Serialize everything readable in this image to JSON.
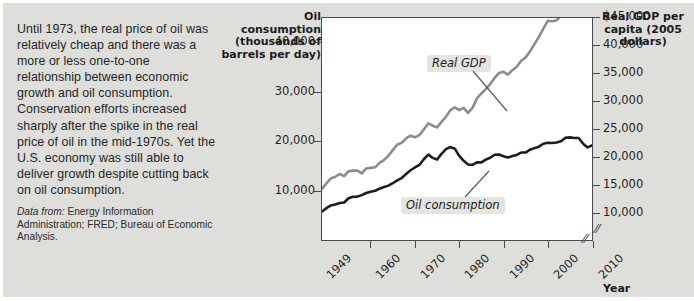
{
  "caption": {
    "body": "Until 1973, the real price of oil was relatively cheap and there was a more or less one-to-one relationship between economic growth and oil consumption. Conservation efforts increased sharply after the spike in the real price of oil in the mid-1970s. Yet the U.S. economy was still able to deliver growth despite cutting back on oil consumption.",
    "source_lead": "Data from:",
    "source_text": " Energy Information Administration; FRED; Bureau of Economic Analysis."
  },
  "chart_data": {
    "type": "line",
    "title": "",
    "xlabel": "Year",
    "ylabel": "Oil consumption (thousands of barrels per day)",
    "y2label": "Real GDP per capita (2005 dollars)",
    "grid": false,
    "legend_position": "in-plot-annotations",
    "axis_break": true,
    "x": [
      1949,
      1950,
      1951,
      1952,
      1953,
      1954,
      1955,
      1956,
      1957,
      1958,
      1959,
      1960,
      1961,
      1962,
      1963,
      1964,
      1965,
      1966,
      1967,
      1968,
      1969,
      1970,
      1971,
      1972,
      1973,
      1974,
      1975,
      1976,
      1977,
      1978,
      1979,
      1980,
      1981,
      1982,
      1983,
      1984,
      1985,
      1986,
      1987,
      1988,
      1989,
      1990,
      1991,
      1992,
      1993,
      1994,
      1995,
      1996,
      1997,
      1998,
      1999,
      2000,
      2001,
      2002,
      2003,
      2004,
      2005,
      2006,
      2007,
      2008,
      2009,
      2010
    ],
    "xlim": [
      1949,
      2010
    ],
    "xticks": [
      1949,
      1960,
      1970,
      1980,
      1990,
      2000,
      2010
    ],
    "xtick_labels": [
      "1949",
      "1960",
      "1970",
      "1980",
      "1990",
      "2000",
      "2010"
    ],
    "ylim": [
      0,
      45000
    ],
    "yticks": [
      10000,
      20000,
      30000,
      40000
    ],
    "ytick_labels": [
      "10,000",
      "20,000",
      "30,000",
      "40,000"
    ],
    "y2lim": [
      5000,
      45000
    ],
    "y2ticks": [
      10000,
      15000,
      20000,
      25000,
      30000,
      35000,
      40000,
      45000
    ],
    "y2tick_labels": [
      "10,000",
      "15,000",
      "20,000",
      "25,000",
      "30,000",
      "35,000",
      "40,000",
      "$45,000"
    ],
    "series": [
      {
        "name": "Oil consumption",
        "axis": "left",
        "color": "#1d1d1f",
        "units": "thousands of barrels per day",
        "values": [
          5760,
          6460,
          7000,
          7200,
          7500,
          7600,
          8460,
          8780,
          8800,
          9100,
          9530,
          9800,
          9980,
          10400,
          10740,
          11020,
          11510,
          12080,
          12560,
          13390,
          14140,
          14700,
          15210,
          16370,
          17310,
          16650,
          16320,
          17460,
          18430,
          18850,
          18510,
          17060,
          16060,
          15300,
          15230,
          15730,
          15730,
          16280,
          16670,
          17280,
          17320,
          16990,
          16710,
          17030,
          17240,
          17720,
          17720,
          18310,
          18620,
          18920,
          19520,
          19700,
          19650,
          19760,
          20030,
          20730,
          20800,
          20690,
          20680,
          19500,
          18770,
          19180
        ]
      },
      {
        "name": "Real GDP",
        "axis": "right",
        "color": "#8c8c90",
        "units": "2005 dollars per capita",
        "values": [
          14200,
          15200,
          16100,
          16400,
          16900,
          16500,
          17400,
          17500,
          17500,
          17000,
          17900,
          18000,
          18100,
          18900,
          19400,
          20200,
          21200,
          22200,
          22500,
          23300,
          23800,
          23500,
          23900,
          24900,
          26000,
          25600,
          25300,
          26300,
          27200,
          28400,
          28900,
          28400,
          28800,
          27900,
          28800,
          30500,
          31400,
          32200,
          33100,
          34200,
          35100,
          35300,
          34800,
          35600,
          36200,
          37300,
          37900,
          39000,
          40300,
          41600,
          43100,
          44500,
          44400,
          44600,
          45400,
          46700,
          47700,
          48400,
          48500,
          47800,
          45900,
          46900
        ]
      }
    ],
    "annotations": [
      {
        "text": "Real GDP",
        "series": "Real GDP"
      },
      {
        "text": "Oil consumption",
        "series": "Oil consumption"
      }
    ]
  }
}
